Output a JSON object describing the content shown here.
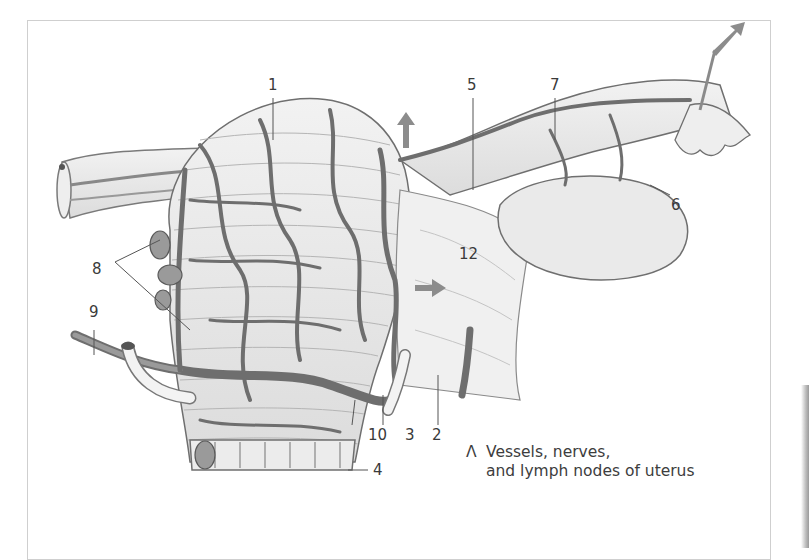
{
  "figure": {
    "panel_letter": "Λ",
    "caption_line1": "Vessels, nerves,",
    "caption_line2": "and lymph nodes of uterus"
  },
  "labels": {
    "l1": "1",
    "l2": "2",
    "l3": "3",
    "l4": "4",
    "l5": "5",
    "l6": "6",
    "l7": "7",
    "l8": "8",
    "l9": "9",
    "l10": "10",
    "l12": "12"
  },
  "colors": {
    "vessel": "#6e6e6e",
    "tissue": "#e6e6e6",
    "outline": "#7a7a7a",
    "arrow": "#8c8c8c",
    "text": "#3a3a3a"
  }
}
